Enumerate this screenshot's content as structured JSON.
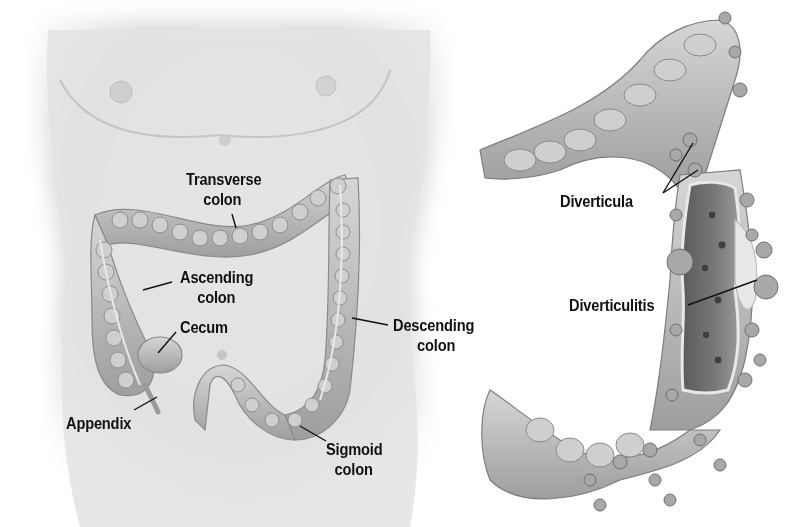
{
  "figure": {
    "left_panel": {
      "subject": "torso with colon",
      "labels": [
        {
          "id": "transverse",
          "line1": "Transverse",
          "line2": "colon"
        },
        {
          "id": "ascending",
          "line1": "Ascending",
          "line2": "colon"
        },
        {
          "id": "cecum",
          "line1": "Cecum",
          "line2": ""
        },
        {
          "id": "appendix",
          "line1": "Appendix",
          "line2": ""
        },
        {
          "id": "descending",
          "line1": "Descending",
          "line2": "colon"
        },
        {
          "id": "sigmoid",
          "line1": "Sigmoid",
          "line2": "colon"
        }
      ]
    },
    "right_panel": {
      "subject": "colon cross-section with diverticula",
      "labels": [
        {
          "id": "diverticula",
          "line1": "Diverticula"
        },
        {
          "id": "diverticulitis",
          "line1": "Diverticulitis"
        }
      ]
    },
    "colors": {
      "background": "#ffffff",
      "skin": "#e6e6e6",
      "skin_shade": "#c9c9c9",
      "colon": "#bdbdbd",
      "colon_dark": "#8a8a8a",
      "lumen": "#6e6e6e",
      "label_text": "#111111"
    }
  }
}
